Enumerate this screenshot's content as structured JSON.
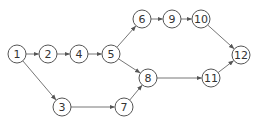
{
  "diagram": {
    "type": "network",
    "nodes": [
      {
        "id": "1",
        "label": "1"
      },
      {
        "id": "2",
        "label": "2"
      },
      {
        "id": "3",
        "label": "3"
      },
      {
        "id": "4",
        "label": "4"
      },
      {
        "id": "5",
        "label": "5"
      },
      {
        "id": "6",
        "label": "6"
      },
      {
        "id": "7",
        "label": "7"
      },
      {
        "id": "8",
        "label": "8"
      },
      {
        "id": "9",
        "label": "9"
      },
      {
        "id": "10",
        "label": "10"
      },
      {
        "id": "11",
        "label": "11"
      },
      {
        "id": "12",
        "label": "12"
      }
    ],
    "edges": [
      {
        "from": "1",
        "to": "2"
      },
      {
        "from": "2",
        "to": "4"
      },
      {
        "from": "4",
        "to": "5"
      },
      {
        "from": "1",
        "to": "3"
      },
      {
        "from": "3",
        "to": "7"
      },
      {
        "from": "7",
        "to": "8"
      },
      {
        "from": "5",
        "to": "6"
      },
      {
        "from": "5",
        "to": "8"
      },
      {
        "from": "6",
        "to": "9"
      },
      {
        "from": "9",
        "to": "10"
      },
      {
        "from": "10",
        "to": "12"
      },
      {
        "from": "8",
        "to": "11"
      },
      {
        "from": "11",
        "to": "12"
      }
    ]
  }
}
